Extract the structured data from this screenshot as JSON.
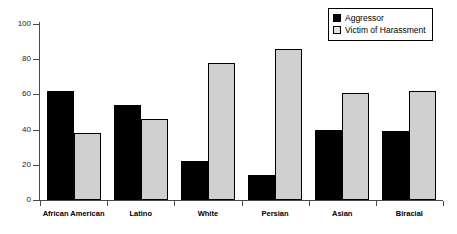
{
  "chart_data": {
    "type": "bar",
    "title": "",
    "xlabel": "",
    "ylabel": "",
    "ylim": [
      0,
      100
    ],
    "yticks": [
      0,
      20,
      40,
      60,
      80,
      100
    ],
    "grid": false,
    "legend_position": "top-right",
    "categories": [
      "African American",
      "Latino",
      "White",
      "Persian",
      "Asian",
      "Biracial"
    ],
    "series": [
      {
        "name": "Aggressor",
        "color": "#000000",
        "fill": "solid-black",
        "values": [
          62,
          54,
          22,
          14,
          40,
          39
        ]
      },
      {
        "name": "Victim of Harassment",
        "color": "#d0d0d0",
        "fill": "light-dotted",
        "values": [
          38,
          46,
          78,
          86,
          61,
          62
        ]
      }
    ]
  },
  "legend": {
    "entries": [
      {
        "label": "Aggressor",
        "swatch": "solid-black-swatch"
      },
      {
        "label": "Victim of Harassment",
        "swatch": "dotted-gray-swatch"
      }
    ]
  },
  "axis": {
    "y_tick_labels": [
      "100",
      "80",
      "60",
      "40",
      "20",
      "0"
    ]
  }
}
